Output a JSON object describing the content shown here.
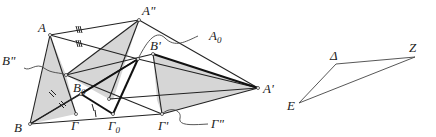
{
  "figure": {
    "colors": {
      "stroke": "#222222",
      "fill_shade": "#d6d6d6",
      "background": "#ffffff"
    },
    "labels": {
      "A": "A",
      "A2": "A\"",
      "A0": "A",
      "A0_sub": "0",
      "B1": "B'",
      "B2": "B\"",
      "B": "B",
      "B0": "B",
      "B0_sub": "0",
      "G": "Γ",
      "G0": "Γ",
      "G0_sub": "0",
      "G1": "Γ'",
      "G2": "Γ\"",
      "A1": "A'",
      "D": "Δ",
      "Z": "Z",
      "E": "E"
    }
  }
}
